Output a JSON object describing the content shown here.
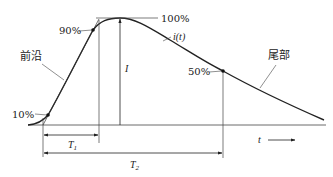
{
  "diagram": {
    "type": "lightning-current-waveform",
    "labels": {
      "leading_edge": "前沿",
      "tail": "尾部",
      "curve": "i(t)",
      "peak_current": "I",
      "time_axis": "t",
      "pct_10": "10%",
      "pct_90": "90%",
      "pct_100": "100%",
      "pct_50": "50%",
      "t1": "T",
      "t1_sub": "1",
      "t2": "T",
      "t2_sub": "2"
    },
    "colors": {
      "stroke": "#222222",
      "background": "#ffffff"
    },
    "key_points": [
      {
        "name": "10%",
        "x": 48,
        "y": 115
      },
      {
        "name": "90%",
        "x": 93,
        "y": 30
      },
      {
        "name": "100%",
        "x": 120,
        "y": 18
      },
      {
        "name": "50%",
        "x": 223,
        "y": 71
      }
    ]
  }
}
